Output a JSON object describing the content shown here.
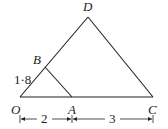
{
  "diagram": {
    "type": "geometry",
    "points": {
      "O": {
        "label": "O",
        "x": 20,
        "y": 97
      },
      "A": {
        "label": "A",
        "x": 72,
        "y": 97
      },
      "C": {
        "label": "C",
        "x": 153,
        "y": 97
      },
      "D": {
        "label": "D",
        "x": 88,
        "y": 17
      },
      "B": {
        "label": "B",
        "x": 45,
        "y": 66
      }
    },
    "segments": [
      [
        "O",
        "C"
      ],
      [
        "O",
        "D"
      ],
      [
        "D",
        "C"
      ],
      [
        "B",
        "A"
      ]
    ],
    "measurements": {
      "OB": "1·8",
      "OA": "2",
      "AC": "3"
    }
  }
}
